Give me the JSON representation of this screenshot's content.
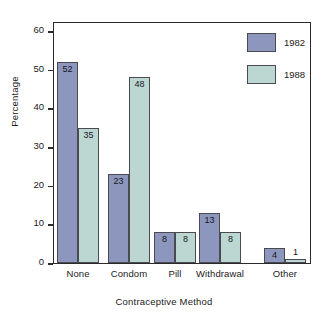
{
  "chart_data": {
    "type": "bar",
    "title": "",
    "xlabel": "Contraceptive Method",
    "ylabel": "Percentage",
    "categories": [
      "None",
      "Condom",
      "Pill",
      "Withdrawal",
      "Other"
    ],
    "series": [
      {
        "name": "1982",
        "color": "#8d96bd",
        "values": [
          52,
          23,
          8,
          13,
          4
        ]
      },
      {
        "name": "1988",
        "color": "#bcd7d2",
        "values": [
          35,
          48,
          8,
          8,
          1
        ]
      }
    ],
    "ylim": [
      0,
      60
    ],
    "yticks": [
      0,
      10,
      20,
      30,
      40,
      50,
      60
    ],
    "ytick_labels": [
      "0",
      "10",
      "20",
      "30",
      "40",
      "50",
      "60"
    ],
    "grid": false,
    "legend_position": "top-right",
    "data_labels_shown": true
  },
  "axes": {
    "y_title": "Percentage",
    "x_title": "Contraceptive Method",
    "y_ticks": [
      {
        "label": "60",
        "value": 60
      },
      {
        "label": "50",
        "value": 50
      },
      {
        "label": "40",
        "value": 40
      },
      {
        "label": "30",
        "value": 30
      },
      {
        "label": "20",
        "value": 20
      },
      {
        "label": "10",
        "value": 10
      },
      {
        "label": "0",
        "value": 0
      }
    ],
    "x_ticks": [
      {
        "label": "None"
      },
      {
        "label": "Condom"
      },
      {
        "label": "Pill"
      },
      {
        "label": "Withdrawal"
      },
      {
        "label": "Other"
      }
    ]
  },
  "legend": {
    "items": [
      {
        "label": "1982",
        "color": "#8d96bd"
      },
      {
        "label": "1988",
        "color": "#bcd7d2"
      }
    ]
  },
  "bars": [
    {
      "group": "None",
      "series": "1982",
      "value": 52,
      "label": "52"
    },
    {
      "group": "None",
      "series": "1988",
      "value": 35,
      "label": "35"
    },
    {
      "group": "Condom",
      "series": "1982",
      "value": 23,
      "label": "23"
    },
    {
      "group": "Condom",
      "series": "1988",
      "value": 48,
      "label": "48"
    },
    {
      "group": "Pill",
      "series": "1982",
      "value": 8,
      "label": "8"
    },
    {
      "group": "Pill",
      "series": "1988",
      "value": 8,
      "label": "8"
    },
    {
      "group": "Withdrawal",
      "series": "1982",
      "value": 13,
      "label": "13"
    },
    {
      "group": "Withdrawal",
      "series": "1988",
      "value": 8,
      "label": "8"
    },
    {
      "group": "Other",
      "series": "1982",
      "value": 4,
      "label": "4"
    },
    {
      "group": "Other",
      "series": "1988",
      "value": 1,
      "label": "1"
    }
  ],
  "colors": {
    "series_1982": "#8d96bd",
    "series_1988": "#bcd7d2",
    "axis": "#2b2b2b",
    "background": "#ffffff"
  }
}
